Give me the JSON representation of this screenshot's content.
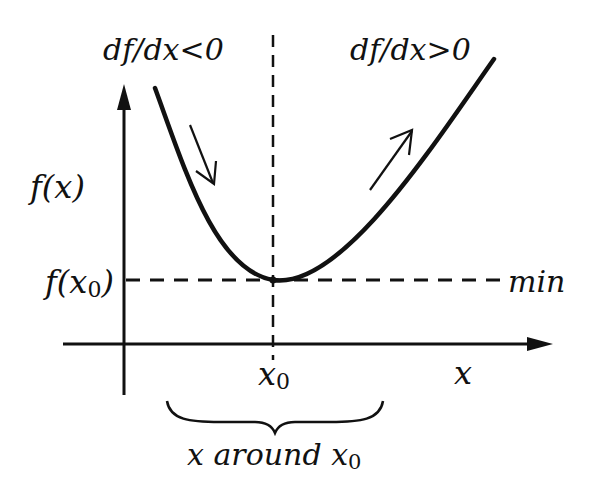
{
  "diagram": {
    "title": "",
    "labels": {
      "slope_negative": "df/dx<0",
      "slope_positive": "df/dx>0",
      "y_axis": "f(x)",
      "min_value": "f(x",
      "min_value_sub": "0",
      "min_value_close": ")",
      "min_tag": "min",
      "x_axis": "x",
      "x0": "x",
      "x0_sub": "0",
      "neighborhood": "x around x",
      "neighborhood_sub": "0"
    },
    "colors": {
      "ink": "#111111",
      "background": "#ffffff"
    },
    "geometry": {
      "y_axis_x": 124,
      "x_axis_y": 344,
      "minimum_point": [
        273,
        280
      ],
      "curve_start": [
        155,
        88
      ],
      "curve_end": [
        494,
        59
      ]
    }
  }
}
